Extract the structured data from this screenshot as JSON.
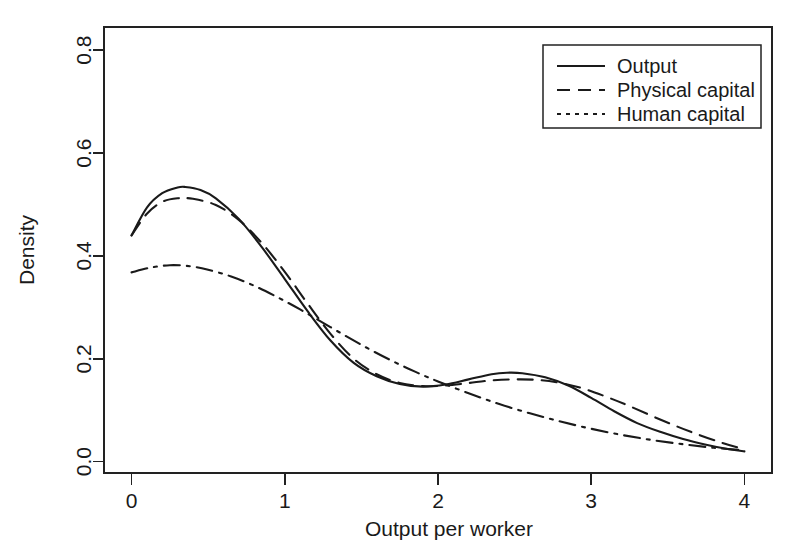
{
  "chart_data": {
    "type": "line",
    "title": "",
    "xlabel": "Output per worker",
    "ylabel": "Density",
    "xlim": [
      -0.18,
      4.18
    ],
    "ylim": [
      -0.022,
      0.845
    ],
    "xticks": [
      0,
      1,
      2,
      3,
      4
    ],
    "xtick_labels": [
      "0",
      "1",
      "2",
      "3",
      "4"
    ],
    "yticks": [
      0.0,
      0.2,
      0.4,
      0.6,
      0.8
    ],
    "ytick_labels": [
      "0.0",
      "0.2",
      "0.4",
      "0.6",
      "0.8"
    ],
    "grid": false,
    "legend_position": "top-right",
    "line_color": "#1a1a1a",
    "series": [
      {
        "name": "Output",
        "style": "solid",
        "dasharray": "",
        "x": [
          0.0,
          0.1,
          0.2,
          0.3,
          0.35,
          0.45,
          0.55,
          0.7,
          0.85,
          1.0,
          1.15,
          1.3,
          1.45,
          1.6,
          1.75,
          1.9,
          2.05,
          2.2,
          2.35,
          2.45,
          2.55,
          2.7,
          2.85,
          3.0,
          3.15,
          3.3,
          3.45,
          3.6,
          3.75,
          3.9,
          4.0
        ],
        "y": [
          0.44,
          0.494,
          0.522,
          0.533,
          0.534,
          0.528,
          0.512,
          0.472,
          0.417,
          0.355,
          0.292,
          0.235,
          0.192,
          0.166,
          0.151,
          0.146,
          0.15,
          0.16,
          0.17,
          0.173,
          0.172,
          0.164,
          0.148,
          0.124,
          0.098,
          0.075,
          0.058,
          0.044,
          0.033,
          0.024,
          0.02
        ]
      },
      {
        "name": "Physical capital",
        "style": "dashed",
        "dasharray": "15,9",
        "x": [
          0.0,
          0.1,
          0.2,
          0.3,
          0.4,
          0.55,
          0.7,
          0.85,
          1.0,
          1.15,
          1.3,
          1.45,
          1.6,
          1.75,
          1.9,
          2.05,
          2.2,
          2.35,
          2.5,
          2.65,
          2.8,
          2.95,
          3.1,
          3.25,
          3.45,
          3.65,
          3.85,
          4.0
        ],
        "y": [
          0.44,
          0.482,
          0.505,
          0.512,
          0.511,
          0.499,
          0.47,
          0.425,
          0.369,
          0.307,
          0.248,
          0.2,
          0.17,
          0.153,
          0.147,
          0.148,
          0.153,
          0.158,
          0.16,
          0.159,
          0.153,
          0.142,
          0.126,
          0.108,
          0.082,
          0.058,
          0.037,
          0.024
        ]
      },
      {
        "name": "Human capital",
        "style": "dashdot",
        "dasharray": "16,7,3,7",
        "x": [
          0.0,
          0.12,
          0.25,
          0.38,
          0.5,
          0.65,
          0.8,
          0.95,
          1.1,
          1.25,
          1.4,
          1.55,
          1.7,
          1.85,
          2.0,
          2.2,
          2.4,
          2.6,
          2.8,
          3.0,
          3.2,
          3.4,
          3.6,
          3.8,
          4.0
        ],
        "y": [
          0.368,
          0.377,
          0.382,
          0.38,
          0.373,
          0.36,
          0.342,
          0.32,
          0.296,
          0.27,
          0.244,
          0.219,
          0.196,
          0.175,
          0.156,
          0.133,
          0.112,
          0.094,
          0.078,
          0.064,
          0.052,
          0.042,
          0.034,
          0.027,
          0.022
        ]
      }
    ]
  },
  "legend": {
    "items": [
      {
        "label": "Output",
        "style": "solid"
      },
      {
        "label": "Physical capital",
        "style": "dashed"
      },
      {
        "label": "Human capital",
        "style": "dashdot"
      }
    ]
  }
}
